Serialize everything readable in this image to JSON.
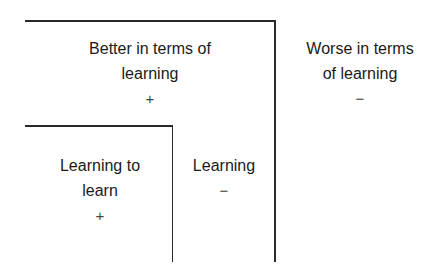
{
  "diagram": {
    "outer_region": {
      "title_line1": "Better in terms of",
      "title_line2": "learning",
      "sign": "+"
    },
    "outside_region": {
      "title_line1": "Worse in terms",
      "title_line2": "of learning",
      "sign": "−"
    },
    "inner_region": {
      "title_line1": "Learning to",
      "title_line2": "learn",
      "sign": "+"
    },
    "middle_region": {
      "title_line1": "Learning",
      "sign": "−"
    },
    "colors": {
      "line": "#2a2a2a",
      "text": "#1a1a1a",
      "background": "#ffffff"
    }
  }
}
